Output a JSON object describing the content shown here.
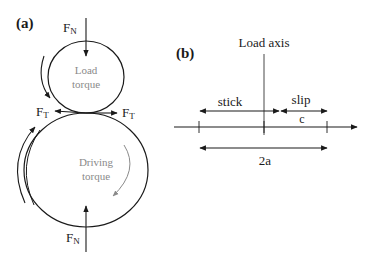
{
  "panel_a": {
    "label": "(a)",
    "top_force": {
      "main": "F",
      "sub": "N"
    },
    "bottom_force": {
      "main": "F",
      "sub": "N"
    },
    "left_tangential": {
      "main": "F",
      "sub": "T"
    },
    "right_tangential": {
      "main": "F",
      "sub": "T"
    },
    "upper_roller_label_1": "Load",
    "upper_roller_label_2": "torque",
    "lower_roller_label_1": "Driving",
    "lower_roller_label_2": "torque"
  },
  "panel_b": {
    "label": "(b)",
    "axis_label": "Load axis",
    "stick_label": "stick",
    "slip_label": "slip",
    "c_label": "c",
    "width_label": "2a"
  },
  "colors": {
    "line": "#1a1a1a",
    "gray_text": "#8a8a8a",
    "gray_arrow": "#8a8a8a"
  }
}
